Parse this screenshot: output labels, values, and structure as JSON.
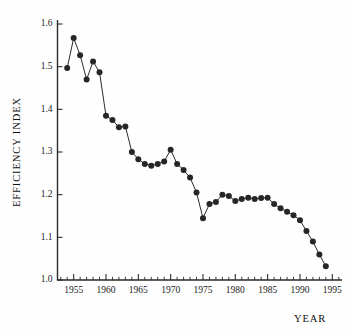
{
  "chart_data": {
    "type": "line",
    "title": "",
    "xlabel": "YEAR",
    "ylabel": "EFFICIENCY INDEX",
    "xlim": [
      1952.5,
      1996.5
    ],
    "ylim": [
      1.0,
      1.6
    ],
    "grid": false,
    "legend": null,
    "markers": "filled-circle",
    "marker_color": "#262626",
    "line_color": "#2b2b2b",
    "background": "#fefefe",
    "y_ticks": [
      1.0,
      1.1,
      1.2,
      1.3,
      1.4,
      1.5,
      1.6
    ],
    "y_tick_labels": [
      "1.0",
      "1.1",
      "1.2",
      "1.3",
      "1.4",
      "1.5",
      "1.6"
    ],
    "x_ticks": [
      1955,
      1960,
      1965,
      1970,
      1975,
      1980,
      1985,
      1990,
      1995
    ],
    "x_tick_labels": [
      "1955",
      "1960",
      "1965",
      "1970",
      "1975",
      "1980",
      "1985",
      "1990",
      "1995"
    ],
    "x_minor_tick_step": 1,
    "x": [
      1954,
      1955,
      1956,
      1957,
      1958,
      1959,
      1960,
      1961,
      1962,
      1963,
      1964,
      1965,
      1966,
      1967,
      1968,
      1969,
      1970,
      1971,
      1972,
      1973,
      1974,
      1975,
      1976,
      1977,
      1978,
      1979,
      1980,
      1981,
      1982,
      1983,
      1984,
      1985,
      1986,
      1987,
      1988,
      1989,
      1990,
      1991,
      1992,
      1993,
      1994
    ],
    "y": [
      1.497,
      1.567,
      1.527,
      1.47,
      1.512,
      1.487,
      1.385,
      1.375,
      1.358,
      1.36,
      1.3,
      1.283,
      1.272,
      1.268,
      1.272,
      1.278,
      1.305,
      1.272,
      1.258,
      1.24,
      1.205,
      1.145,
      1.178,
      1.183,
      1.2,
      1.197,
      1.185,
      1.19,
      1.193,
      1.19,
      1.192,
      1.193,
      1.178,
      1.168,
      1.16,
      1.152,
      1.14,
      1.115,
      1.09,
      1.06,
      1.032
    ],
    "series": [
      {
        "name": "Efficiency Index",
        "values": [
          1.497,
          1.567,
          1.527,
          1.47,
          1.512,
          1.487,
          1.385,
          1.375,
          1.358,
          1.36,
          1.3,
          1.283,
          1.272,
          1.268,
          1.272,
          1.278,
          1.305,
          1.272,
          1.258,
          1.24,
          1.205,
          1.145,
          1.178,
          1.183,
          1.2,
          1.197,
          1.185,
          1.19,
          1.193,
          1.19,
          1.192,
          1.193,
          1.178,
          1.168,
          1.16,
          1.152,
          1.14,
          1.115,
          1.09,
          1.06,
          1.032
        ]
      }
    ]
  }
}
